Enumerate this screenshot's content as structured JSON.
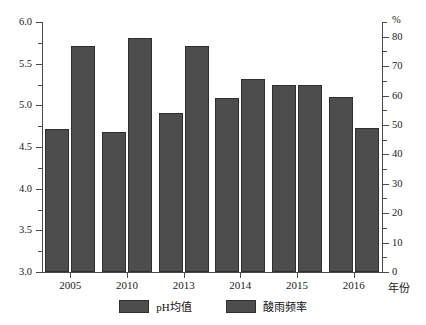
{
  "chart_data": {
    "type": "bar",
    "title": "",
    "subtitle": "",
    "xlabel": "年份",
    "categories": [
      "2005",
      "2010",
      "2013",
      "2014",
      "2015",
      "2016"
    ],
    "grid": false,
    "legend_position": "bottom",
    "series": [
      {
        "name": "pH均值",
        "axis": "left",
        "values": [
          4.72,
          4.68,
          4.91,
          5.09,
          5.25,
          5.1
        ],
        "color": "#4d4d4d"
      },
      {
        "name": "酸雨频率",
        "axis": "right",
        "values": [
          77.0,
          79.5,
          77.0,
          65.5,
          63.5,
          49.0
        ],
        "color": "#4d4d4d"
      }
    ],
    "left_axis": {
      "label": "",
      "unit": "",
      "ylim": [
        3.0,
        6.0
      ],
      "ticks": [
        3.0,
        3.5,
        4.0,
        4.5,
        5.0,
        5.5,
        6.0
      ],
      "tick_labels": [
        "3.0",
        "3.5",
        "4.0",
        "4.5",
        "5.0",
        "5.5",
        "6.0"
      ],
      "minor_ticks": [
        3.25,
        3.75,
        4.25,
        4.75,
        5.25,
        5.75
      ]
    },
    "right_axis": {
      "label": "",
      "unit": "%",
      "ylim": [
        0,
        85
      ],
      "ticks": [
        0,
        10,
        20,
        30,
        40,
        50,
        60,
        70,
        80
      ],
      "tick_labels": [
        "0",
        "10",
        "20",
        "30",
        "40",
        "50",
        "60",
        "70",
        "80"
      ],
      "minor_ticks": [
        5,
        15,
        25,
        35,
        45,
        55,
        65,
        75,
        85
      ]
    }
  }
}
